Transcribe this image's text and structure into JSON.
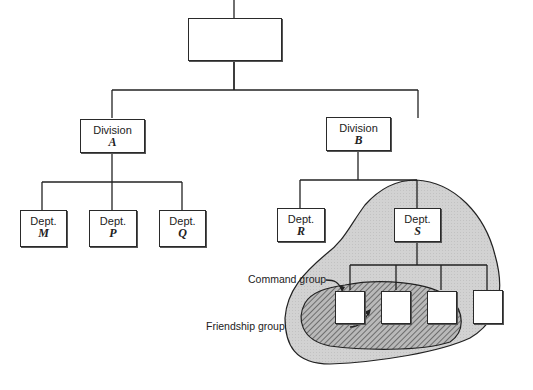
{
  "diagram": {
    "type": "organization-chart",
    "top_box": {
      "label": ""
    },
    "divisions": [
      {
        "line1": "Division",
        "line2": "A"
      },
      {
        "line1": "Division",
        "line2": "B"
      }
    ],
    "departments": [
      {
        "line1": "Dept.",
        "line2": "M"
      },
      {
        "line1": "Dept.",
        "line2": "P"
      },
      {
        "line1": "Dept.",
        "line2": "Q"
      },
      {
        "line1": "Dept.",
        "line2": "R"
      },
      {
        "line1": "Dept.",
        "line2": "S"
      }
    ],
    "subordinates_of_S": 4,
    "annotations": {
      "command_group": "Command group",
      "friendship_group": "Friendship group"
    },
    "colors": {
      "command_group_fill": "#cfcfcf",
      "friendship_hatch": "#555555",
      "lines": "#222222"
    }
  }
}
